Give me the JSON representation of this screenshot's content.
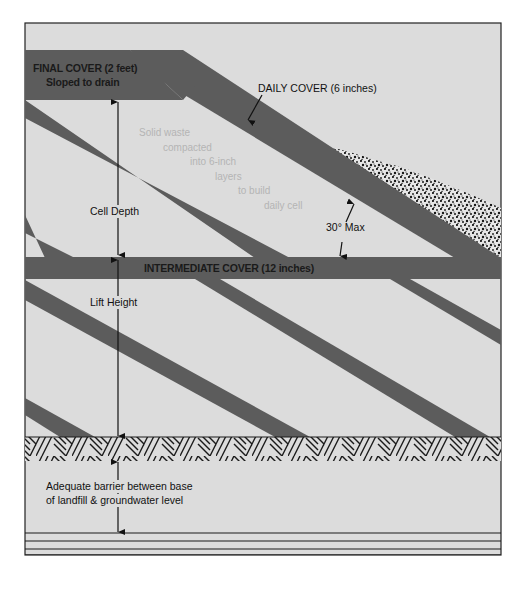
{
  "diagram": {
    "type": "landfill cross-section",
    "labels": {
      "final_cover_line1": "FINAL COVER (2 feet)",
      "final_cover_line2": "Sloped to drain",
      "daily_cover": "DAILY COVER (6 inches)",
      "solid_waste": [
        "Solid waste",
        "compacted",
        "into 6-inch",
        "layers",
        "to build",
        "daily cell"
      ],
      "cell_depth": "Cell Depth",
      "slope_angle": "30° Max",
      "intermediate_cover": "INTERMEDIATE COVER (12 inches)",
      "lift_height": "Lift Height",
      "barrier_line1": "Adequate barrier between base",
      "barrier_line2": "of landfill & groundwater level"
    },
    "layers": [
      {
        "name": "final-cover",
        "thickness": "2 feet"
      },
      {
        "name": "daily-cover",
        "thickness": "6 inches"
      },
      {
        "name": "intermediate-cover",
        "thickness": "12 inches"
      },
      {
        "name": "landfill-base"
      },
      {
        "name": "groundwater"
      }
    ],
    "colors": {
      "background": "#dcdcdc",
      "cover_band": "#5c5c5c",
      "frame": "#222222",
      "faint_text": "#b4b4b4"
    }
  }
}
